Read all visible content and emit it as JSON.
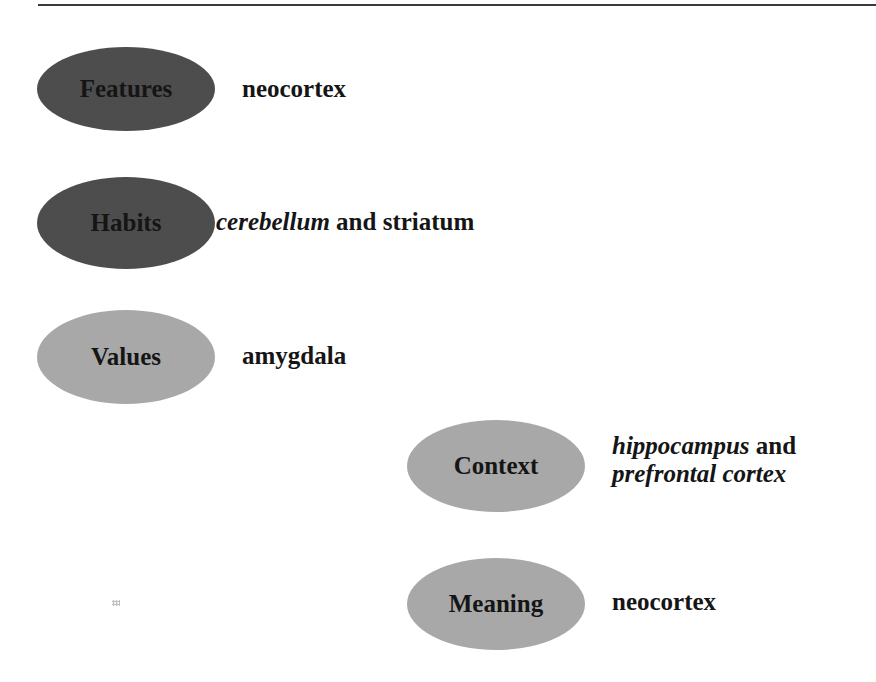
{
  "diagram": {
    "type": "memory-systems-brain-regions",
    "nodes": [
      {
        "id": "features",
        "label": "Features",
        "shade": "dark",
        "region_parts": [
          {
            "text": "neocortex",
            "italic": false
          }
        ]
      },
      {
        "id": "habits",
        "label": "Habits",
        "shade": "dark",
        "region_parts": [
          {
            "text": "cerebellum",
            "italic": true
          },
          {
            "text": " and striatum",
            "italic": false
          }
        ]
      },
      {
        "id": "values",
        "label": "Values",
        "shade": "light",
        "region_parts": [
          {
            "text": "amygdala",
            "italic": false
          }
        ]
      },
      {
        "id": "context",
        "label": "Context",
        "shade": "light",
        "region_parts": [
          {
            "text": "hippocampus",
            "italic": true
          },
          {
            "text": " and",
            "italic": false
          },
          {
            "text": "prefrontal cortex",
            "italic": true
          }
        ]
      },
      {
        "id": "meaning",
        "label": "Meaning",
        "shade": "light",
        "region_parts": [
          {
            "text": "neocortex",
            "italic": false
          }
        ]
      }
    ],
    "colors": {
      "dark_ellipse": "#7a7a7a",
      "light_ellipse": "#cfcfcf",
      "text": "#151515",
      "rule": "#3a3a3a"
    }
  }
}
